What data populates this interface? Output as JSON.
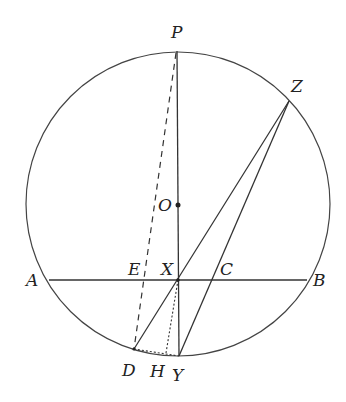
{
  "diagram": {
    "type": "geometry",
    "circle": {
      "center": [
        178,
        204
      ],
      "radius": 152
    },
    "points": {
      "P": {
        "label": "P",
        "x": 177,
        "y": 51,
        "lx": 171,
        "ly": 38
      },
      "Z": {
        "label": "Z",
        "x": 289,
        "y": 101,
        "lx": 291,
        "ly": 92
      },
      "O": {
        "label": "O",
        "x": 178,
        "y": 205,
        "lx": 158,
        "ly": 205
      },
      "A": {
        "label": "A",
        "x": 49,
        "y": 280,
        "lx": 26,
        "ly": 286
      },
      "B": {
        "label": "B",
        "x": 307,
        "y": 280,
        "lx": 313,
        "ly": 286
      },
      "E": {
        "label": "E",
        "x": 143,
        "y": 280,
        "lx": 128,
        "ly": 275
      },
      "X": {
        "label": "X",
        "x": 178,
        "y": 280,
        "lx": 161,
        "ly": 275
      },
      "C": {
        "label": "C",
        "x": 213,
        "y": 280,
        "lx": 220,
        "ly": 275
      },
      "D": {
        "label": "D",
        "x": 134,
        "y": 349,
        "lx": 122,
        "ly": 375
      },
      "H": {
        "label": "H",
        "x": 166,
        "y": 353,
        "lx": 150,
        "ly": 377
      },
      "Y": {
        "label": "Y",
        "x": 179,
        "y": 356,
        "lx": 172,
        "ly": 380
      }
    },
    "solid_segments": [
      [
        "P",
        "Y"
      ],
      [
        "A",
        "B"
      ],
      [
        "D",
        "Z"
      ],
      [
        "Y",
        "Z"
      ]
    ],
    "dashed_segments": [
      [
        "P",
        "D"
      ]
    ],
    "dotted_segments": [
      [
        "D",
        "Y"
      ],
      [
        "X",
        "H"
      ]
    ],
    "colors": {
      "stroke": "#333333",
      "label": "#222222"
    }
  }
}
